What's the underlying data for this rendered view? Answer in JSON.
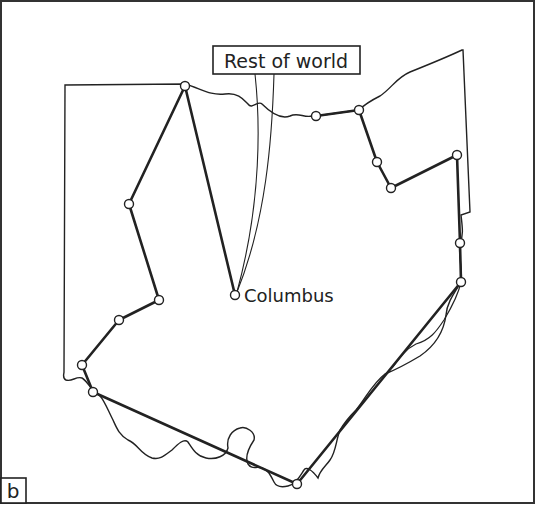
{
  "figure": {
    "panel_label": "b",
    "callout_label": "Rest of world",
    "city_label": "Columbus"
  },
  "colors": {
    "ink": "#222222",
    "background": "#ffffff"
  },
  "tour_nodes": [
    {
      "id": "n1",
      "x": 185,
      "y": 86
    },
    {
      "id": "n2",
      "x": 129,
      "y": 204
    },
    {
      "id": "n3",
      "x": 159,
      "y": 300
    },
    {
      "id": "n4",
      "x": 119,
      "y": 320
    },
    {
      "id": "n5",
      "x": 82,
      "y": 365
    },
    {
      "id": "n6",
      "x": 93,
      "y": 392
    },
    {
      "id": "n7",
      "x": 297,
      "y": 484
    },
    {
      "id": "n8",
      "x": 461,
      "y": 282
    },
    {
      "id": "n9",
      "x": 460,
      "y": 243
    },
    {
      "id": "n10",
      "x": 457,
      "y": 155
    },
    {
      "id": "n11",
      "x": 391,
      "y": 188
    },
    {
      "id": "n12",
      "x": 377,
      "y": 162
    },
    {
      "id": "n13",
      "x": 359,
      "y": 110
    },
    {
      "id": "n14",
      "x": 316,
      "y": 116
    },
    {
      "id": "n15",
      "x": 235,
      "y": 295
    }
  ]
}
